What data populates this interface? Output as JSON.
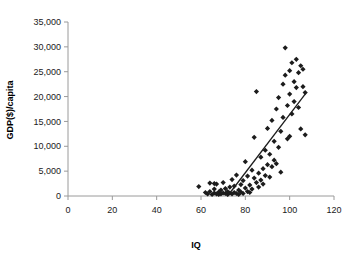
{
  "chart_data": {
    "type": "scatter",
    "title": "",
    "xlabel": "IQ",
    "ylabel": "GDP($)/capita",
    "xlim": [
      0,
      120
    ],
    "ylim": [
      0,
      35000
    ],
    "xticks": [
      0,
      20,
      40,
      60,
      80,
      100,
      120
    ],
    "xticklabels": [
      "0",
      "20",
      "40",
      "60",
      "80",
      "100",
      "120"
    ],
    "yticks": [
      0,
      5000,
      10000,
      15000,
      20000,
      25000,
      30000,
      35000
    ],
    "yticklabels": [
      "0",
      "5,000",
      "10,000",
      "15,000",
      "20,000",
      "25,000",
      "30,000",
      "35,000"
    ],
    "grid": false,
    "legend": false,
    "marker": "diamond",
    "marker_color": "#1c1c1c",
    "points": [
      [
        59,
        1900
      ],
      [
        62,
        700
      ],
      [
        63,
        400
      ],
      [
        64,
        900
      ],
      [
        64,
        2600
      ],
      [
        65,
        300
      ],
      [
        66,
        2500
      ],
      [
        66,
        1400
      ],
      [
        66,
        600
      ],
      [
        67,
        400
      ],
      [
        67,
        2400
      ],
      [
        68,
        800
      ],
      [
        68,
        300
      ],
      [
        69,
        1200
      ],
      [
        69,
        400
      ],
      [
        70,
        600
      ],
      [
        70,
        2700
      ],
      [
        71,
        500
      ],
      [
        71,
        1500
      ],
      [
        72,
        300
      ],
      [
        72,
        900
      ],
      [
        73,
        1800
      ],
      [
        73,
        600
      ],
      [
        74,
        400
      ],
      [
        74,
        3300
      ],
      [
        75,
        700
      ],
      [
        75,
        2000
      ],
      [
        76,
        500
      ],
      [
        76,
        4200
      ],
      [
        77,
        1200
      ],
      [
        77,
        300
      ],
      [
        78,
        2300
      ],
      [
        78,
        800
      ],
      [
        79,
        3100
      ],
      [
        79,
        500
      ],
      [
        80,
        1600
      ],
      [
        80,
        6900
      ],
      [
        81,
        900
      ],
      [
        81,
        4000
      ],
      [
        82,
        2200
      ],
      [
        82,
        700
      ],
      [
        83,
        5200
      ],
      [
        83,
        1400
      ],
      [
        84,
        3600
      ],
      [
        84,
        11800
      ],
      [
        85,
        2700
      ],
      [
        85,
        21000
      ],
      [
        86,
        4600
      ],
      [
        86,
        1800
      ],
      [
        87,
        7800
      ],
      [
        87,
        3200
      ],
      [
        88,
        5500
      ],
      [
        88,
        2400
      ],
      [
        89,
        9200
      ],
      [
        89,
        4100
      ],
      [
        90,
        6300
      ],
      [
        90,
        13600
      ],
      [
        91,
        3800
      ],
      [
        91,
        8400
      ],
      [
        92,
        5900
      ],
      [
        92,
        15200
      ],
      [
        93,
        7200
      ],
      [
        93,
        11000
      ],
      [
        94,
        17500
      ],
      [
        94,
        6500
      ],
      [
        95,
        9800
      ],
      [
        95,
        19800
      ],
      [
        96,
        13000
      ],
      [
        96,
        4800
      ],
      [
        97,
        22500
      ],
      [
        97,
        15800
      ],
      [
        98,
        29800
      ],
      [
        98,
        24300
      ],
      [
        99,
        18200
      ],
      [
        99,
        11500
      ],
      [
        100,
        25200
      ],
      [
        100,
        20500
      ],
      [
        100,
        12000
      ],
      [
        101,
        26800
      ],
      [
        101,
        16500
      ],
      [
        102,
        23000
      ],
      [
        102,
        19000
      ],
      [
        103,
        27500
      ],
      [
        103,
        21800
      ],
      [
        104,
        24800
      ],
      [
        104,
        17800
      ],
      [
        105,
        26200
      ],
      [
        105,
        13500
      ],
      [
        106,
        25500
      ],
      [
        106,
        22000
      ],
      [
        107,
        20800
      ],
      [
        107,
        12300
      ]
    ],
    "trendline": {
      "x1": 72,
      "y1": 0,
      "x2": 107,
      "y2": 20500
    }
  }
}
